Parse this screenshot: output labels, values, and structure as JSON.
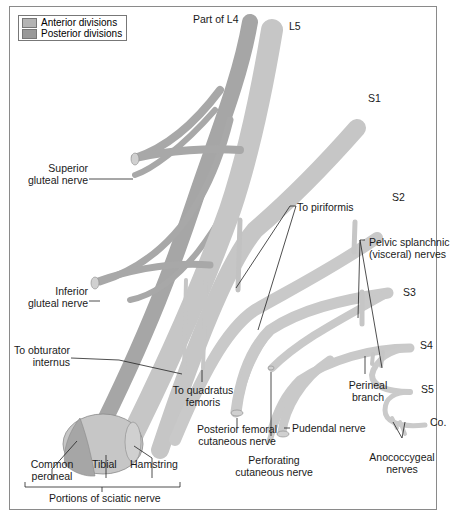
{
  "legend": {
    "items": [
      {
        "label": "Anterior divisions",
        "color": "#b4b4b4"
      },
      {
        "label": "Posterior divisions",
        "color": "#999999"
      }
    ]
  },
  "roots": {
    "l4": "Part of L4",
    "l5": "L5",
    "s1": "S1",
    "s2": "S2",
    "s3": "S3",
    "s4": "S4",
    "s5": "S5",
    "co": "Co."
  },
  "labels": {
    "superior_gluteal_1": "Superior",
    "superior_gluteal_2": "gluteal nerve",
    "inferior_gluteal_1": "Inferior",
    "inferior_gluteal_2": "gluteal nerve",
    "to_piriformis": "To piriformis",
    "pelvic_splanchnic_1": "Pelvic splanchnic",
    "pelvic_splanchnic_2": "(visceral) nerves",
    "to_obturator_1": "To obturator",
    "to_obturator_2": "internus",
    "to_quadratus_1": "To quadratus",
    "to_quadratus_2": "femoris",
    "perineal_1": "Perineal",
    "perineal_2": "branch",
    "posterior_femoral_1": "Posterior femoral",
    "posterior_femoral_2": "cutaneous nerve",
    "pudendal": "Pudendal nerve",
    "perforating_1": "Perforating",
    "perforating_2": "cutaneous nerve",
    "anococcygeal_1": "Anococcygeal",
    "anococcygeal_2": "nerves",
    "common_peroneal_1": "Common",
    "common_peroneal_2": "peroneal",
    "tibial": "Tibial",
    "hamstring": "Hamstring",
    "portions": "Portions of sciatic nerve"
  },
  "colors": {
    "anterior": "#c4c4c4",
    "posterior": "#a2a2a2",
    "outline": "#8a8a8a",
    "leader": "#222222"
  }
}
